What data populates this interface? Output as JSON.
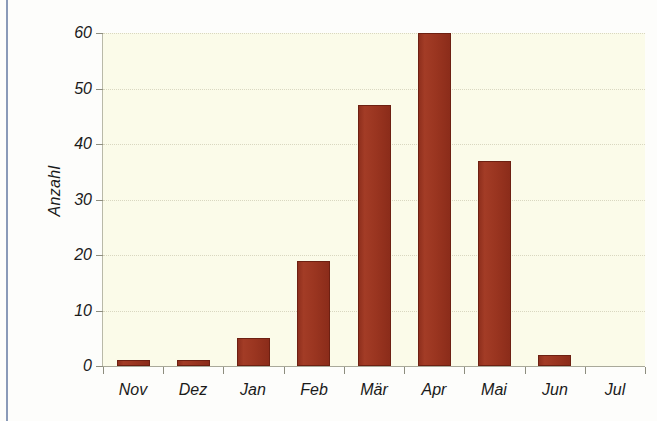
{
  "chart_data": {
    "type": "bar",
    "title": "",
    "subtitle": "",
    "xlabel": "",
    "ylabel": "Anzahl",
    "categories": [
      "Nov",
      "Dez",
      "Jan",
      "Feb",
      "Mär",
      "Apr",
      "Mai",
      "Jun",
      "Jul"
    ],
    "values": [
      1,
      1,
      5,
      19,
      47,
      60,
      37,
      2,
      0
    ],
    "series": [
      {
        "name": "Anzahl",
        "values": [
          1,
          1,
          5,
          19,
          47,
          60,
          37,
          2,
          0
        ]
      }
    ],
    "ylim": [
      0,
      60
    ],
    "yticks": [
      0,
      10,
      20,
      30,
      40,
      50,
      60
    ],
    "ytick_labels": [
      "0",
      "10",
      "20",
      "30",
      "40",
      "50",
      "60"
    ],
    "grid": true,
    "grid_axis": "y",
    "legend": false,
    "legend_position": "none",
    "bar_color": "#9a3520",
    "bar_edge_color": "#6d2012",
    "plot_background": "#fbfbe9",
    "figure_background": "#fdfdfb",
    "gridline_color": "#d9d7c0",
    "axis_color": "#a9a99a",
    "frame_rule_color": "#8a9ab8",
    "text_color": "#1a1a1a"
  }
}
